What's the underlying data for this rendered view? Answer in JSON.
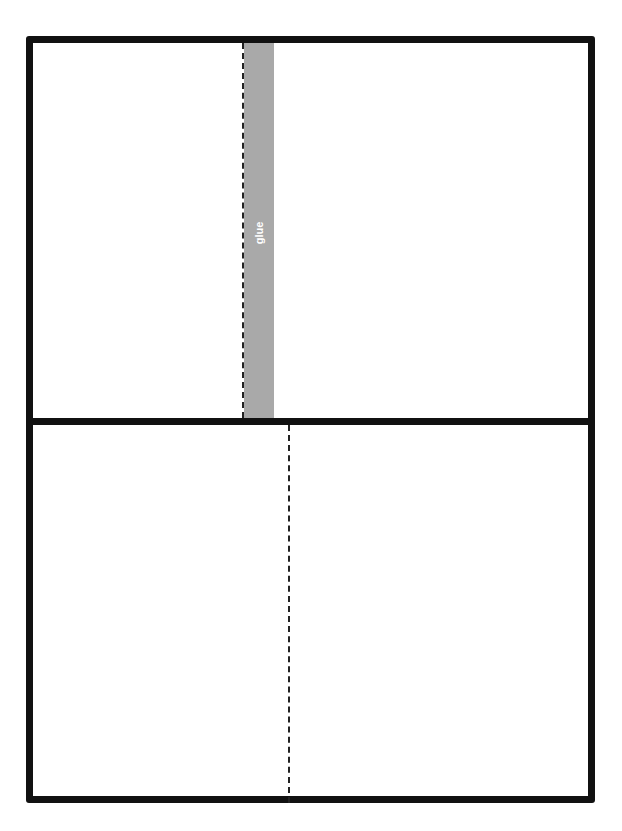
{
  "diagram": {
    "type": "paper-craft template",
    "panels": [
      "top",
      "bottom"
    ],
    "glue_strip": {
      "label": "glue",
      "color": "#a9a9a9"
    },
    "fold_lines": [
      "top-left-of-glue",
      "bottom-center"
    ],
    "border_color": "#111111"
  }
}
